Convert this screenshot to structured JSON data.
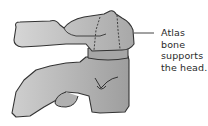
{
  "diagram": {
    "label_lines": [
      "Atlas bone",
      "supports",
      "the head."
    ],
    "colors": {
      "bone_fill": "#b8b8b8",
      "bone_fill_light": "#d4d4d4",
      "bone_fill_dark": "#a0a0a0",
      "outline": "#333333",
      "leader_line": "#444444",
      "text": "#2a2a2a"
    }
  }
}
